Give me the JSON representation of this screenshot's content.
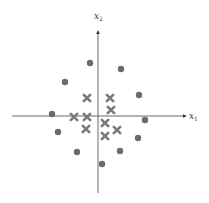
{
  "diagram": {
    "type": "scatter-classification",
    "axes": {
      "x_label": "x",
      "x_sub": "1",
      "y_label": "x",
      "y_sub": "2",
      "origin_px": [
        98,
        116
      ],
      "x_range_px": [
        12,
        188
      ],
      "y_range_px": [
        30,
        193
      ]
    },
    "colors": {
      "axis": "#444444",
      "circle": "#6b6b6b",
      "cross": "#7a7a7a"
    },
    "circles": [
      [
        90,
        63
      ],
      [
        121,
        69
      ],
      [
        65,
        82
      ],
      [
        139,
        95
      ],
      [
        52,
        114
      ],
      [
        145,
        120
      ],
      [
        58,
        132
      ],
      [
        138,
        138
      ],
      [
        77,
        152
      ],
      [
        120,
        151
      ],
      [
        102,
        164
      ]
    ],
    "crosses": [
      [
        87,
        98
      ],
      [
        110,
        98
      ],
      [
        111,
        110
      ],
      [
        74,
        117
      ],
      [
        87,
        117
      ],
      [
        105,
        123
      ],
      [
        86,
        129
      ],
      [
        117,
        130
      ],
      [
        105,
        136
      ]
    ]
  },
  "caption": {
    "text": ""
  }
}
